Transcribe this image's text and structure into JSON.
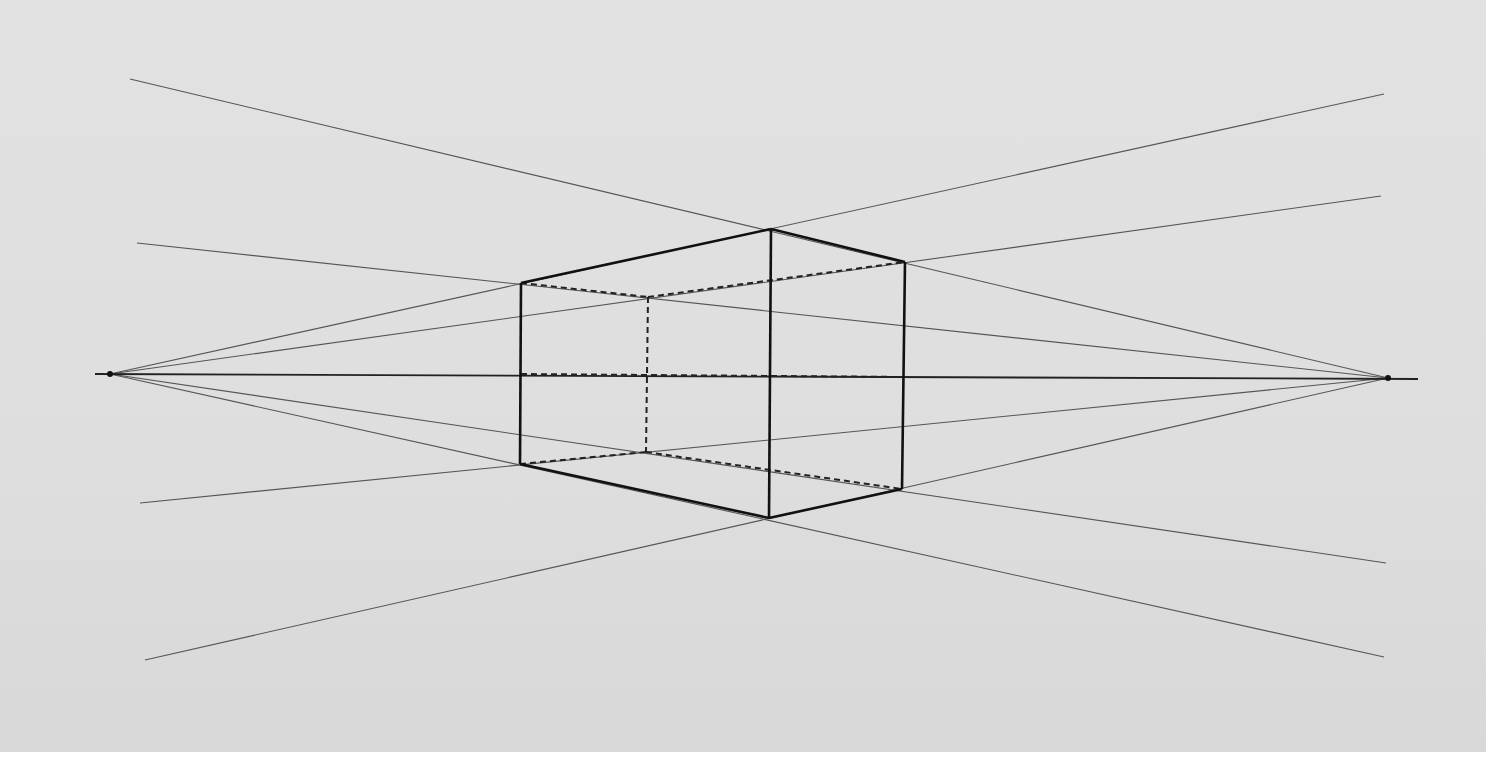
{
  "colors": {
    "paper": "#dfdfdf",
    "ink": "#111111",
    "guide": "#555555"
  },
  "vanishing_points": {
    "left": [
      110,
      374
    ],
    "right": [
      1388,
      378
    ]
  },
  "horizon": {
    "x1": 95,
    "y1": 374,
    "x2": 1418,
    "y2": 379
  },
  "box": {
    "front_top": [
      771,
      229
    ],
    "front_bottom": [
      769,
      518
    ],
    "left_top": [
      521,
      283
    ],
    "left_bottom": [
      520,
      464
    ],
    "right_top": [
      905,
      262
    ],
    "right_bottom": [
      902,
      489
    ],
    "hidden_top": [
      648,
      297
    ],
    "hidden_bottom": [
      646,
      452
    ]
  },
  "guide_lines": [
    [
      130,
      79,
      1388,
      378
    ],
    [
      137,
      243,
      1388,
      378
    ],
    [
      140,
      503,
      1388,
      378
    ],
    [
      145,
      660,
      1388,
      378
    ],
    [
      110,
      374,
      1384,
      94
    ],
    [
      110,
      374,
      1381,
      196
    ],
    [
      110,
      374,
      1386,
      563
    ],
    [
      110,
      374,
      1384,
      657
    ]
  ]
}
